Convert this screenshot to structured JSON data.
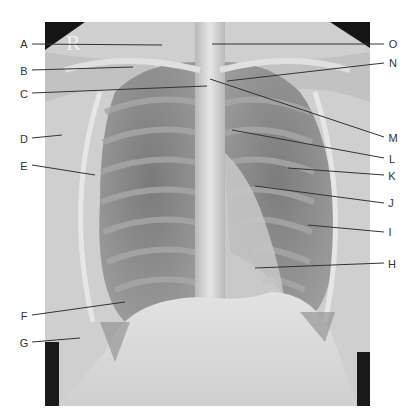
{
  "figure": {
    "side_marker": "R",
    "frame": {
      "x": 45,
      "y": 22,
      "width": 325,
      "height": 384
    },
    "line_color": "#333333",
    "label_color": "#333333"
  },
  "labels": [
    {
      "id": "A",
      "text": "A",
      "label_x": 24,
      "label_y": 44,
      "line": [
        32,
        44,
        162,
        45
      ]
    },
    {
      "id": "B",
      "text": "B",
      "label_x": 24,
      "label_y": 71,
      "line": [
        32,
        70,
        133,
        67
      ]
    },
    {
      "id": "C",
      "text": "C",
      "label_x": 24,
      "label_y": 94,
      "line": [
        32,
        93,
        207,
        86
      ]
    },
    {
      "id": "D",
      "text": "D",
      "label_x": 24,
      "label_y": 139,
      "line": [
        32,
        138,
        62,
        135
      ]
    },
    {
      "id": "E",
      "text": "E",
      "label_x": 24,
      "label_y": 166,
      "line": [
        32,
        165,
        95,
        175
      ]
    },
    {
      "id": "F",
      "text": "F",
      "label_x": 24,
      "label_y": 316,
      "line": [
        32,
        315,
        125,
        302
      ]
    },
    {
      "id": "G",
      "text": "G",
      "label_x": 24,
      "label_y": 343,
      "line": [
        32,
        342,
        80,
        338
      ]
    },
    {
      "id": "H",
      "text": "H",
      "label_x": 392,
      "label_y": 264,
      "line": [
        384,
        263,
        255,
        268
      ]
    },
    {
      "id": "I",
      "text": "I",
      "label_x": 390,
      "label_y": 232,
      "line": [
        384,
        232,
        308,
        225
      ]
    },
    {
      "id": "J",
      "text": "J",
      "label_x": 391,
      "label_y": 203,
      "line": [
        384,
        203,
        255,
        186
      ]
    },
    {
      "id": "K",
      "text": "K",
      "label_x": 392,
      "label_y": 176,
      "line": [
        384,
        175,
        288,
        168
      ]
    },
    {
      "id": "L",
      "text": "L",
      "label_x": 392,
      "label_y": 159,
      "line": [
        384,
        158,
        232,
        130
      ]
    },
    {
      "id": "M",
      "text": "M",
      "label_x": 393,
      "label_y": 138,
      "line": [
        384,
        137,
        210,
        79
      ]
    },
    {
      "id": "N",
      "text": "N",
      "label_x": 393,
      "label_y": 63,
      "line": [
        384,
        63,
        227,
        81
      ]
    },
    {
      "id": "O",
      "text": "O",
      "label_x": 393,
      "label_y": 44,
      "line": [
        384,
        44,
        212,
        44
      ]
    }
  ]
}
